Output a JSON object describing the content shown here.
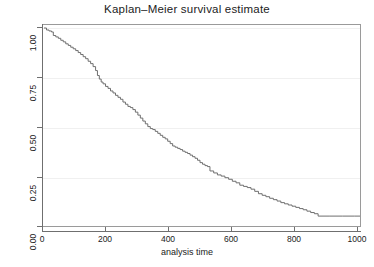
{
  "chart_data": {
    "type": "line",
    "title": "Kaplan–Meier survival estimate",
    "subtitle": "",
    "xlabel": "analysis time",
    "ylabel": "",
    "xlim": [
      0,
      1020
    ],
    "ylim": [
      0,
      1
    ],
    "grid": true,
    "grid_axis": "y",
    "legend": "none",
    "step": true,
    "line_color": "#6e6e6e",
    "xticks": [
      0,
      200,
      400,
      600,
      800,
      1000
    ],
    "xtick_labels": [
      "0",
      "200",
      "400",
      "600",
      "800",
      "1000"
    ],
    "yticks": [
      0.0,
      0.25,
      0.5,
      0.75,
      1.0
    ],
    "ytick_labels": [
      "0.00",
      "0.25",
      "0.50",
      "0.75",
      "1.00"
    ],
    "series": [
      {
        "name": "Survivor function",
        "x": [
          0,
          8,
          16,
          24,
          30,
          38,
          46,
          54,
          62,
          70,
          78,
          86,
          94,
          102,
          110,
          118,
          126,
          134,
          142,
          150,
          158,
          166,
          172,
          178,
          184,
          190,
          198,
          206,
          214,
          222,
          230,
          238,
          246,
          254,
          262,
          270,
          278,
          286,
          294,
          302,
          310,
          318,
          326,
          334,
          342,
          350,
          358,
          366,
          374,
          382,
          390,
          398,
          406,
          414,
          422,
          430,
          438,
          446,
          454,
          462,
          470,
          478,
          486,
          494,
          502,
          510,
          518,
          526,
          534,
          546,
          558,
          570,
          582,
          594,
          606,
          618,
          630,
          642,
          654,
          666,
          678,
          690,
          702,
          714,
          726,
          738,
          750,
          762,
          774,
          786,
          798,
          810,
          822,
          834,
          846,
          858,
          870,
          882,
          920,
          960,
          1000,
          1020
        ],
        "y": [
          1.0,
          0.99,
          0.985,
          0.98,
          0.962,
          0.955,
          0.948,
          0.938,
          0.93,
          0.92,
          0.912,
          0.903,
          0.895,
          0.886,
          0.876,
          0.866,
          0.855,
          0.845,
          0.832,
          0.82,
          0.805,
          0.785,
          0.76,
          0.742,
          0.727,
          0.718,
          0.705,
          0.695,
          0.682,
          0.672,
          0.66,
          0.65,
          0.64,
          0.626,
          0.615,
          0.604,
          0.598,
          0.588,
          0.575,
          0.56,
          0.545,
          0.53,
          0.516,
          0.502,
          0.492,
          0.487,
          0.478,
          0.468,
          0.458,
          0.448,
          0.44,
          0.428,
          0.416,
          0.404,
          0.398,
          0.392,
          0.386,
          0.378,
          0.372,
          0.366,
          0.358,
          0.35,
          0.342,
          0.332,
          0.32,
          0.312,
          0.305,
          0.3,
          0.278,
          0.268,
          0.258,
          0.252,
          0.244,
          0.236,
          0.226,
          0.218,
          0.206,
          0.2,
          0.194,
          0.186,
          0.175,
          0.163,
          0.155,
          0.148,
          0.14,
          0.133,
          0.126,
          0.118,
          0.112,
          0.106,
          0.1,
          0.094,
          0.088,
          0.082,
          0.075,
          0.068,
          0.062,
          0.05,
          0.05,
          0.05,
          0.05,
          0.05
        ]
      }
    ]
  }
}
